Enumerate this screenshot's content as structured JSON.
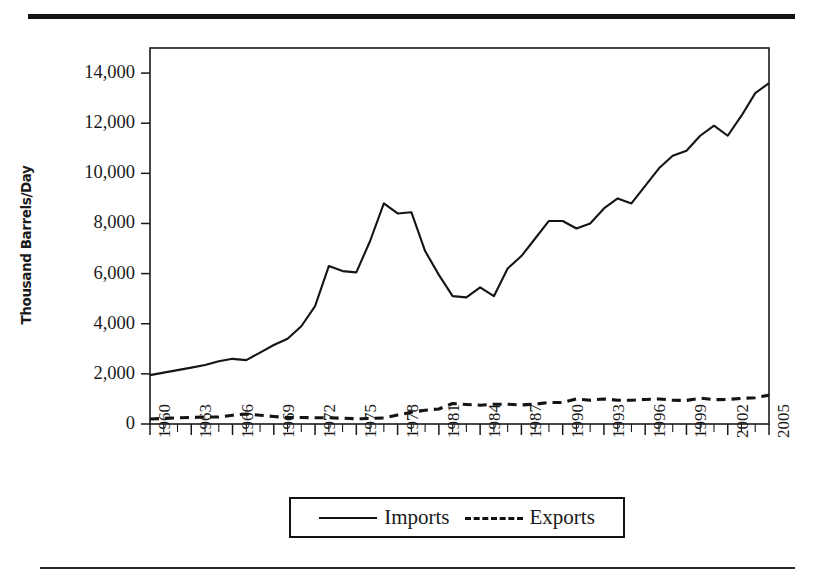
{
  "figure": {
    "has_top_rule": true,
    "has_bottom_rule": true,
    "rule_color": "#141414"
  },
  "legend": {
    "position": "bottom-center",
    "entries": [
      {
        "label": "Imports",
        "style": "solid"
      },
      {
        "label": "Exports",
        "style": "dashed"
      }
    ]
  },
  "chart_data": {
    "type": "line",
    "title": "",
    "subtitle": "",
    "xlabel": "",
    "ylabel": "Thousand Barrels/Day",
    "ylim": [
      0,
      15000
    ],
    "xlim": [
      1960,
      2005
    ],
    "grid": false,
    "yticks": [
      0,
      2000,
      4000,
      6000,
      8000,
      10000,
      12000,
      14000
    ],
    "ytick_labels": [
      "0",
      "2,000",
      "4,000",
      "6,000",
      "8,000",
      "10,000",
      "12,000",
      "14,000"
    ],
    "xticks": [
      1960,
      1963,
      1966,
      1969,
      1972,
      1975,
      1978,
      1981,
      1984,
      1987,
      1990,
      1993,
      1996,
      1999,
      2002,
      2005
    ],
    "xtick_labels": [
      "1960",
      "1963",
      "1966",
      "1969",
      "1972",
      "1975",
      "1978",
      "1981",
      "1984",
      "1987",
      "1990",
      "1993",
      "1996",
      "1999",
      "2002",
      "2005"
    ],
    "xtick_minor_every": 1,
    "x": [
      1960,
      1961,
      1962,
      1963,
      1964,
      1965,
      1966,
      1967,
      1968,
      1969,
      1970,
      1971,
      1972,
      1973,
      1974,
      1975,
      1976,
      1977,
      1978,
      1979,
      1980,
      1981,
      1982,
      1983,
      1984,
      1985,
      1986,
      1987,
      1988,
      1989,
      1990,
      1991,
      1992,
      1993,
      1994,
      1995,
      1996,
      1997,
      1998,
      1999,
      2000,
      2001,
      2002,
      2003,
      2004,
      2005
    ],
    "series": [
      {
        "name": "Imports",
        "style": "solid",
        "color": "#141414",
        "values": [
          1950,
          2050,
          2150,
          2250,
          2350,
          2500,
          2600,
          2550,
          2850,
          3150,
          3400,
          3900,
          4700,
          6300,
          6100,
          6050,
          7300,
          8800,
          8400,
          8450,
          6900,
          5950,
          5100,
          5050,
          5450,
          5100,
          6200,
          6700,
          7400,
          8100,
          8100,
          7800,
          8000,
          8600,
          9000,
          8800,
          9500,
          10200,
          10700,
          10900,
          11500,
          11900,
          11500,
          12300,
          13200,
          13600
        ]
      },
      {
        "name": "Exports",
        "style": "dashed",
        "color": "#141414",
        "values": [
          200,
          220,
          250,
          260,
          280,
          280,
          350,
          400,
          350,
          300,
          260,
          260,
          250,
          250,
          230,
          210,
          220,
          240,
          360,
          470,
          550,
          600,
          820,
          780,
          750,
          790,
          790,
          760,
          790,
          860,
          860,
          1000,
          950,
          1000,
          950,
          950,
          980,
          1000,
          950,
          940,
          1030,
          970,
          980,
          1020,
          1050,
          1150
        ]
      }
    ]
  }
}
